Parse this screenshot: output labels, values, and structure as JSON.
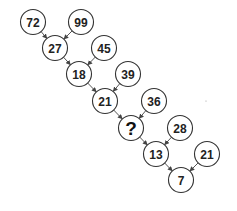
{
  "nodes": [
    {
      "id": "a",
      "label": "72"
    },
    {
      "id": "b",
      "label": "99"
    },
    {
      "id": "c",
      "label": "27"
    },
    {
      "id": "d",
      "label": "45"
    },
    {
      "id": "e",
      "label": "18"
    },
    {
      "id": "f",
      "label": "39"
    },
    {
      "id": "g",
      "label": "21"
    },
    {
      "id": "h",
      "label": "36"
    },
    {
      "id": "i",
      "label": "?",
      "unknown": true
    },
    {
      "id": "j",
      "label": "28"
    },
    {
      "id": "k",
      "label": "13"
    },
    {
      "id": "l",
      "label": "21"
    },
    {
      "id": "m",
      "label": "7"
    }
  ],
  "edges": [
    {
      "from": "a",
      "to": "c"
    },
    {
      "from": "b",
      "to": "c"
    },
    {
      "from": "c",
      "to": "e"
    },
    {
      "from": "d",
      "to": "e"
    },
    {
      "from": "e",
      "to": "g"
    },
    {
      "from": "f",
      "to": "g"
    },
    {
      "from": "g",
      "to": "i"
    },
    {
      "from": "h",
      "to": "i"
    },
    {
      "from": "i",
      "to": "k"
    },
    {
      "from": "j",
      "to": "k"
    },
    {
      "from": "k",
      "to": "m"
    },
    {
      "from": "l",
      "to": "m"
    }
  ]
}
